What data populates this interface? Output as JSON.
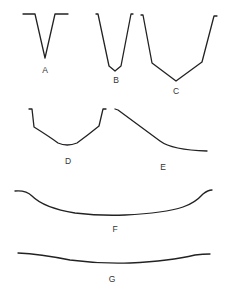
{
  "diagram": {
    "title": "",
    "profiles": [
      {
        "id": "A",
        "label": "A",
        "shape": "sharp narrow V with flat shoulders"
      },
      {
        "id": "B",
        "label": "B",
        "shape": "narrow V with small flattened bottom"
      },
      {
        "id": "C",
        "label": "C",
        "shape": "wide V with angular sides"
      },
      {
        "id": "D",
        "label": "D",
        "shape": "U-shape with rounded bottom and steep upper walls"
      },
      {
        "id": "E",
        "label": "E",
        "shape": "asymmetric slope flattening to the right"
      },
      {
        "id": "F",
        "label": "F",
        "shape": "broad shallow concave curve with raised edges"
      },
      {
        "id": "G",
        "label": "G",
        "shape": "very broad, gently concave curve"
      }
    ],
    "colors": {
      "stroke": "#222222",
      "label": "#333333",
      "background": "#ffffff"
    }
  }
}
